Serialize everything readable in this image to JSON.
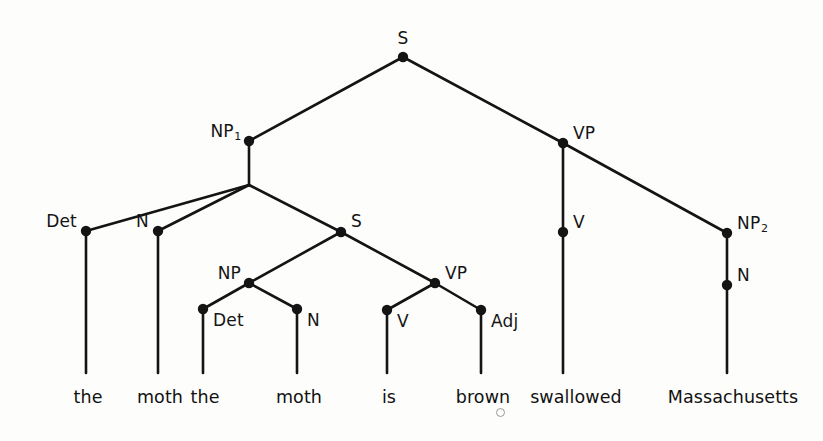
{
  "figure": {
    "type": "syntax-tree",
    "background_color": "#fdfdfc",
    "ink_color": "#141414",
    "sentence": "the moth the moth is brown swallowed Massachusetts"
  },
  "nodes": [
    {
      "id": "s-root",
      "label": "S",
      "sub": "",
      "x": 403,
      "y": 57,
      "label_x": 403,
      "label_y": 30,
      "label_align": "center"
    },
    {
      "id": "np1",
      "label": "NP",
      "sub": "1",
      "x": 249,
      "y": 141,
      "label_x": 241,
      "label_y": 123,
      "label_align": "right"
    },
    {
      "id": "vp-main",
      "label": "VP",
      "sub": "",
      "x": 563,
      "y": 143,
      "label_x": 573,
      "label_y": 125,
      "label_align": "left"
    },
    {
      "id": "det-1",
      "label": "Det",
      "sub": "",
      "x": 86,
      "y": 231,
      "label_x": 77,
      "label_y": 213,
      "label_align": "right"
    },
    {
      "id": "n-1",
      "label": "N",
      "sub": "",
      "x": 158,
      "y": 231,
      "label_x": 149,
      "label_y": 213,
      "label_align": "right"
    },
    {
      "id": "s-embed",
      "label": "S",
      "sub": "",
      "x": 341,
      "y": 232,
      "label_x": 351,
      "label_y": 213,
      "label_align": "left"
    },
    {
      "id": "v-main",
      "label": "V",
      "sub": "",
      "x": 563,
      "y": 232,
      "label_x": 573,
      "label_y": 214,
      "label_align": "left"
    },
    {
      "id": "np2",
      "label": "NP",
      "sub": "2",
      "x": 727,
      "y": 233,
      "label_x": 737,
      "label_y": 215,
      "label_align": "left"
    },
    {
      "id": "np-embed",
      "label": "NP",
      "sub": "",
      "x": 249,
      "y": 283,
      "label_x": 241,
      "label_y": 265,
      "label_align": "right"
    },
    {
      "id": "vp-embed",
      "label": "VP",
      "sub": "",
      "x": 435,
      "y": 283,
      "label_x": 445,
      "label_y": 265,
      "label_align": "left"
    },
    {
      "id": "n-2",
      "label": "N",
      "sub": "",
      "x": 727,
      "y": 285,
      "label_x": 737,
      "label_y": 267,
      "label_align": "left"
    },
    {
      "id": "det-2",
      "label": "Det",
      "sub": "",
      "x": 203,
      "y": 309,
      "label_x": 213,
      "label_y": 312,
      "label_align": "left"
    },
    {
      "id": "n-3",
      "label": "N",
      "sub": "",
      "x": 297,
      "y": 309,
      "label_x": 307,
      "label_y": 312,
      "label_align": "left"
    },
    {
      "id": "v-embed",
      "label": "V",
      "sub": "",
      "x": 387,
      "y": 310,
      "label_x": 397,
      "label_y": 313,
      "label_align": "left"
    },
    {
      "id": "adj",
      "label": "Adj",
      "sub": "",
      "x": 481,
      "y": 310,
      "label_x": 491,
      "label_y": 313,
      "label_align": "left"
    }
  ],
  "junctions": [
    {
      "id": "np1-split",
      "x": 249,
      "y": 185
    }
  ],
  "edges": [
    {
      "id": "root-to-np1",
      "x1": 403,
      "y1": 57,
      "x2": 249,
      "y2": 141
    },
    {
      "id": "root-to-vp",
      "x1": 403,
      "y1": 57,
      "x2": 563,
      "y2": 143
    },
    {
      "id": "np1-stem",
      "x1": 249,
      "y1": 141,
      "x2": 249,
      "y2": 185
    },
    {
      "id": "np1-to-det1",
      "x1": 249,
      "y1": 185,
      "x2": 86,
      "y2": 231
    },
    {
      "id": "np1-to-n1",
      "x1": 249,
      "y1": 185,
      "x2": 158,
      "y2": 231
    },
    {
      "id": "np1-to-sembed",
      "x1": 249,
      "y1": 185,
      "x2": 341,
      "y2": 232
    },
    {
      "id": "vp-to-v",
      "x1": 563,
      "y1": 143,
      "x2": 563,
      "y2": 232
    },
    {
      "id": "vp-to-np2",
      "x1": 563,
      "y1": 143,
      "x2": 727,
      "y2": 233
    },
    {
      "id": "sembed-to-npembed",
      "x1": 341,
      "y1": 232,
      "x2": 249,
      "y2": 283
    },
    {
      "id": "sembed-to-vpembed",
      "x1": 341,
      "y1": 232,
      "x2": 435,
      "y2": 283
    },
    {
      "id": "npembed-to-det2",
      "x1": 249,
      "y1": 283,
      "x2": 203,
      "y2": 309
    },
    {
      "id": "npembed-to-n3",
      "x1": 249,
      "y1": 283,
      "x2": 297,
      "y2": 309
    },
    {
      "id": "vpembed-to-vembed",
      "x1": 435,
      "y1": 283,
      "x2": 387,
      "y2": 310
    },
    {
      "id": "vpembed-to-adj",
      "x1": 435,
      "y1": 283,
      "x2": 481,
      "y2": 310
    },
    {
      "id": "np2-to-n2",
      "x1": 727,
      "y1": 233,
      "x2": 727,
      "y2": 285
    },
    {
      "id": "det1-leaf",
      "x1": 86,
      "y1": 231,
      "x2": 86,
      "y2": 373
    },
    {
      "id": "n1-leaf",
      "x1": 158,
      "y1": 231,
      "x2": 158,
      "y2": 373
    },
    {
      "id": "det2-leaf",
      "x1": 203,
      "y1": 309,
      "x2": 203,
      "y2": 373
    },
    {
      "id": "n3-leaf",
      "x1": 297,
      "y1": 309,
      "x2": 297,
      "y2": 373
    },
    {
      "id": "vembed-leaf",
      "x1": 387,
      "y1": 310,
      "x2": 387,
      "y2": 373
    },
    {
      "id": "adj-leaf",
      "x1": 481,
      "y1": 310,
      "x2": 481,
      "y2": 373
    },
    {
      "id": "vmain-leaf",
      "x1": 563,
      "y1": 232,
      "x2": 563,
      "y2": 373
    },
    {
      "id": "n2-leaf",
      "x1": 727,
      "y1": 285,
      "x2": 727,
      "y2": 373
    }
  ],
  "leaves": [
    {
      "id": "leaf-the-1",
      "word": "the",
      "x": 88,
      "y": 389
    },
    {
      "id": "leaf-moth-1",
      "word": "moth",
      "x": 160,
      "y": 389
    },
    {
      "id": "leaf-the-2",
      "word": "the",
      "x": 205,
      "y": 389
    },
    {
      "id": "leaf-moth-2",
      "word": "moth",
      "x": 299,
      "y": 389
    },
    {
      "id": "leaf-is",
      "word": "is",
      "x": 389,
      "y": 389
    },
    {
      "id": "leaf-brown",
      "word": "brown",
      "x": 483,
      "y": 389
    },
    {
      "id": "leaf-swallowed",
      "word": "swallowed",
      "x": 576,
      "y": 389
    },
    {
      "id": "leaf-massachusetts",
      "word": "Massachusetts",
      "x": 733,
      "y": 389
    }
  ],
  "artifacts": [
    {
      "id": "speck-below-brown",
      "x": 496,
      "y": 408,
      "size": 7
    }
  ]
}
